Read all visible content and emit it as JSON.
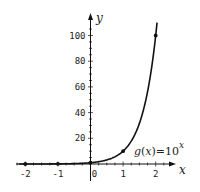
{
  "chart_data": {
    "type": "line",
    "title": "",
    "xlabel": "x",
    "ylabel": "y",
    "xlim": [
      -2.2,
      2.4
    ],
    "ylim": [
      0,
      110
    ],
    "grid": false,
    "x_ticks": [
      -2,
      -1,
      0,
      1,
      2
    ],
    "x_tick_labels": [
      "-2",
      "-1",
      "0",
      "1",
      "2"
    ],
    "y_ticks": [
      20,
      40,
      60,
      80,
      100
    ],
    "y_tick_labels": [
      "20",
      "40",
      "60",
      "80",
      "100"
    ],
    "series": [
      {
        "name": "g(x)=10^x",
        "function": "10^x",
        "points": [
          {
            "x": -2,
            "y": 0.01
          },
          {
            "x": -1,
            "y": 0.1
          },
          {
            "x": 0,
            "y": 1
          },
          {
            "x": 1,
            "y": 10
          },
          {
            "x": 2,
            "y": 100
          }
        ]
      }
    ],
    "annotation": {
      "func": "g",
      "arg": "x",
      "eq": "=10",
      "exponent": "x"
    }
  }
}
